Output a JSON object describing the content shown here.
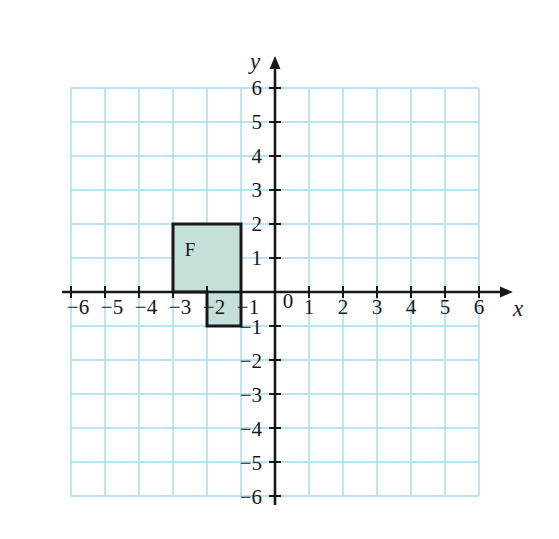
{
  "figure": {
    "background_color": "#ffffff"
  },
  "chart_data": {
    "type": "scatter",
    "title": "",
    "xlabel": "x",
    "ylabel": "y",
    "xlim": [
      -6,
      6
    ],
    "ylim": [
      -6,
      6
    ],
    "grid": true,
    "grid_step": 1,
    "grid_color": "#9fdcee",
    "axis_color": "#16181a",
    "legend": "none",
    "x_ticks": [
      -6,
      -5,
      -4,
      -3,
      -2,
      -1,
      0,
      1,
      2,
      3,
      4,
      5,
      6
    ],
    "y_ticks": [
      -6,
      -5,
      -4,
      -3,
      -2,
      -1,
      0,
      1,
      2,
      3,
      4,
      5,
      6
    ],
    "x_tick_labels": [
      "−6",
      "−5",
      "−4",
      "−3",
      "−2",
      "−1",
      "0",
      "1",
      "2",
      "3",
      "4",
      "5",
      "6"
    ],
    "y_tick_labels": [
      "−6",
      "−5",
      "−4",
      "−3",
      "−2",
      "−1",
      "",
      "1",
      "2",
      "3",
      "4",
      "5",
      "6"
    ],
    "origin_label": "0",
    "shapes": [
      {
        "name": "F",
        "label": "F",
        "label_position": [
          -2.5,
          1.25
        ],
        "fill": "#c5e0da",
        "stroke": "#16181a",
        "stroke_width": 3,
        "vertices": [
          [
            -3,
            2
          ],
          [
            -1,
            2
          ],
          [
            -1,
            -1
          ],
          [
            -2,
            -1
          ],
          [
            -2,
            0
          ],
          [
            -3,
            0
          ]
        ]
      }
    ]
  },
  "axes": {
    "x_axis_name": "x",
    "y_axis_name": "y",
    "x_arrow": "right",
    "y_arrow": "up"
  }
}
